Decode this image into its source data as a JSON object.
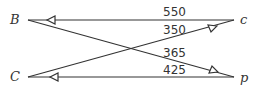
{
  "diagram": {
    "nodes": {
      "left_top": "B",
      "left_bottom": "C",
      "right_top": "c",
      "right_bottom": "p"
    },
    "edges": [
      {
        "from": "c",
        "to": "B",
        "value": "550"
      },
      {
        "from": "C",
        "to": "c",
        "value": "350"
      },
      {
        "from": "B",
        "to": "p",
        "value": "365"
      },
      {
        "from": "p",
        "to": "C",
        "value": "425"
      }
    ],
    "colors": {
      "line": "#333333",
      "background": "#ffffff"
    }
  }
}
